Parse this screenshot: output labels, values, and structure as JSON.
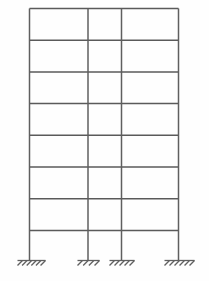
{
  "diagram": {
    "type": "structural-frame-elevation",
    "line_color": "#595959",
    "beam_color": "#5a5a5a",
    "column_color": "#5f5f5f",
    "support_color": "#606060",
    "background_color": "#fefefe",
    "canvas": {
      "width": 209,
      "height": 281
    },
    "counts": {
      "stories": 8,
      "bays": 3,
      "columns": 4,
      "beam_levels": 8,
      "supports": 4
    },
    "geometry": {
      "frame_left": 29.5,
      "frame_right": 178.5,
      "roof_y": 8.5,
      "lowest_beam_y": 230.5,
      "ground_y": 260.5,
      "story_height": 31.7,
      "beam_stroke_width": 1.5,
      "column_stroke_width": 1.5,
      "support_stroke_width": 1.3
    },
    "columns": [
      {
        "name": "column-left-exterior",
        "x": 29.5,
        "top_y": 8.5,
        "base_y": 260.5
      },
      {
        "name": "column-interior-1",
        "x": 88.0,
        "top_y": 8.5,
        "base_y": 260.5
      },
      {
        "name": "column-interior-2",
        "x": 121.5,
        "top_y": 8.5,
        "base_y": 260.5
      },
      {
        "name": "column-right-exterior",
        "x": 178.5,
        "top_y": 8.5,
        "base_y": 260.5
      }
    ],
    "beam_levels": [
      {
        "name": "beam-level-8-roof",
        "y": 8.5,
        "x1": 29.5,
        "x2": 178.5
      },
      {
        "name": "beam-level-7",
        "y": 40.2,
        "x1": 29.5,
        "x2": 178.5
      },
      {
        "name": "beam-level-6",
        "y": 71.9,
        "x1": 29.5,
        "x2": 178.5
      },
      {
        "name": "beam-level-5",
        "y": 103.6,
        "x1": 29.5,
        "x2": 178.5
      },
      {
        "name": "beam-level-4",
        "y": 135.3,
        "x1": 29.5,
        "x2": 178.5
      },
      {
        "name": "beam-level-3",
        "y": 167.0,
        "x1": 29.5,
        "x2": 178.5
      },
      {
        "name": "beam-level-2",
        "y": 198.7,
        "x1": 29.5,
        "x2": 178.5
      },
      {
        "name": "beam-level-1",
        "y": 230.4,
        "x1": 29.5,
        "x2": 178.5
      }
    ],
    "supports": [
      {
        "name": "support-fixed-left-exterior",
        "kind": "fixed-base",
        "column_x": 29.5,
        "ground_y": 260.5,
        "ground_x1": 17.5,
        "ground_x2": 45.5,
        "hatch_count": 6,
        "hatch_length": 7,
        "hatch_angle_deg": 45
      },
      {
        "name": "support-fixed-interior-1",
        "kind": "fixed-base",
        "column_x": 88.0,
        "ground_y": 260.5,
        "ground_x1": 77.5,
        "ground_x2": 99.5,
        "hatch_count": 4,
        "hatch_length": 7,
        "hatch_angle_deg": 45
      },
      {
        "name": "support-fixed-interior-2",
        "kind": "fixed-base",
        "column_x": 121.5,
        "ground_y": 260.5,
        "ground_x1": 109.5,
        "ground_x2": 134.5,
        "hatch_count": 5,
        "hatch_length": 7,
        "hatch_angle_deg": 45
      },
      {
        "name": "support-fixed-right-exterior",
        "kind": "fixed-base",
        "column_x": 178.5,
        "ground_y": 260.5,
        "ground_x1": 164.5,
        "ground_x2": 194.5,
        "hatch_count": 6,
        "hatch_length": 7,
        "hatch_angle_deg": 45
      }
    ]
  }
}
